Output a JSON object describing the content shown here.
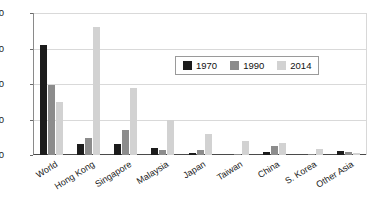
{
  "chart_data": {
    "type": "bar",
    "title": "",
    "subtitle": "",
    "xlabel": "",
    "ylabel": "",
    "ylim": [
      0,
      40
    ],
    "yticks": [
      0,
      10,
      20,
      30,
      40
    ],
    "grid": true,
    "legend_position": "top-right-inside",
    "categories": [
      "World",
      "Hong Kong",
      "Singapore",
      "Malaysia",
      "Japan",
      "Taiwan",
      "China",
      "S. Korea",
      "Other Asia"
    ],
    "series": [
      {
        "name": "1970",
        "color": "#1c1c1c",
        "values": [
          31,
          3,
          3,
          2,
          0.5,
          0,
          0.8,
          0,
          1.2
        ]
      },
      {
        "name": "1990",
        "color": "#8c8c8c",
        "values": [
          19.8,
          4.7,
          7,
          1.5,
          1.5,
          0.3,
          2.5,
          0.2,
          0.8
        ]
      },
      {
        "name": "2014",
        "color": "#d2d2d2",
        "values": [
          15,
          36,
          18.8,
          10,
          6,
          4,
          3.5,
          1.8,
          0.6
        ]
      }
    ]
  },
  "legend": {
    "items": [
      {
        "label": "1970"
      },
      {
        "label": "1990"
      },
      {
        "label": "2014"
      }
    ]
  },
  "axis": {
    "y_tick_labels": [
      "0",
      "10",
      "20",
      "30",
      "40"
    ]
  }
}
